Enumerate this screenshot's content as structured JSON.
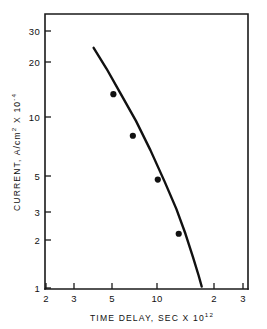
{
  "chart_data": {
    "type": "scatter",
    "title": "",
    "xlabel": "TIME DELAY, SEC X 10",
    "xlabel_exponent": "12",
    "ylabel": "CURRENT, A/cm",
    "ylabel_sup": "2",
    "ylabel_tail": " X 10",
    "ylabel_exponent": "-4",
    "xscale": "log",
    "yscale": "log",
    "xlim": [
      2,
      33
    ],
    "ylim": [
      1,
      35
    ],
    "grid": false,
    "legend": null,
    "xticks": [
      {
        "value": 2,
        "label": "2"
      },
      {
        "value": 3,
        "label": "3"
      },
      {
        "value": 5,
        "label": "5"
      },
      {
        "value": 10,
        "label": "10"
      },
      {
        "value": 20,
        "label": "2"
      },
      {
        "value": 30,
        "label": "3"
      }
    ],
    "yticks": [
      {
        "value": 30,
        "label": "30"
      },
      {
        "value": 20,
        "label": "20"
      },
      {
        "value": 10,
        "label": "10"
      },
      {
        "value": 5,
        "label": "5"
      },
      {
        "value": 3,
        "label": "3"
      },
      {
        "value": 2,
        "label": "2"
      },
      {
        "value": 1,
        "label": "1"
      }
    ],
    "points": [
      {
        "x": 5.05,
        "y": 13.0
      },
      {
        "x": 6.6,
        "y": 7.5
      },
      {
        "x": 9.3,
        "y": 4.2
      },
      {
        "x": 12.4,
        "y": 2.05
      }
    ],
    "series": [
      {
        "name": "fitted-curve",
        "x": [
          3.85,
          4.6,
          5.6,
          6.9,
          8.4,
          10.2,
          12.0,
          13.6,
          15.1,
          16.3,
          17.0
        ],
        "y": [
          24.0,
          18.2,
          13.0,
          9.1,
          6.2,
          4.1,
          2.85,
          2.05,
          1.5,
          1.18,
          1.02
        ]
      }
    ],
    "marker_radius_px": 3.1
  }
}
